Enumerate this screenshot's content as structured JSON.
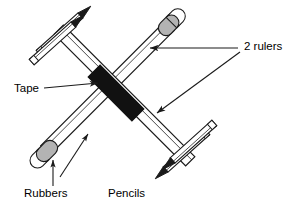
{
  "diagram": {
    "background_color": "#ffffff",
    "line_color": "#1a1a1a",
    "tape_color": "#111111",
    "rubber_color": "#b3b3b3",
    "pencil_tip_color": "#1a1a1a",
    "ruler_fill": "#ffffff"
  },
  "labels": {
    "rulers": {
      "text": "2 rulers",
      "x": 244,
      "y": 50
    },
    "tape": {
      "text": "Tape",
      "x": 14,
      "y": 92
    },
    "rubbers": {
      "text": "Rubbers",
      "x": 24,
      "y": 196
    },
    "pencils": {
      "text": "Pencils",
      "x": 108,
      "y": 196
    }
  },
  "parts": {
    "ruler_a": {
      "name": "ruler-nw-se",
      "from": [
        58,
        28
      ],
      "to": [
        196,
        165
      ]
    },
    "ruler_b": {
      "name": "ruler-ne-sw",
      "from": [
        171,
        24
      ],
      "to": [
        44,
        152
      ]
    },
    "tape": {
      "name": "black-tape",
      "center": [
        115,
        93
      ]
    },
    "rubber_top_right": {
      "name": "rubber-top-right",
      "center": [
        169,
        22
      ]
    },
    "rubber_bottom_left": {
      "name": "rubber-bottom-left",
      "center": [
        45,
        153
      ]
    },
    "pencils_top_left": {
      "name": "pencil-pair-top-left",
      "count": 2,
      "tip_direction": "up-right"
    },
    "pencils_bottom_right": {
      "name": "pencil-pair-bottom-right",
      "count": 2,
      "tip_direction": "down-left"
    }
  },
  "leaders": {
    "rulers_upper": {
      "from": [
        238,
        48
      ],
      "to": [
        146,
        48
      ]
    },
    "rulers_lower": {
      "from": [
        238,
        50
      ],
      "to": [
        152,
        116
      ]
    },
    "tape": {
      "from": [
        44,
        88
      ],
      "to": [
        101,
        84
      ]
    },
    "rubbers": {
      "from": [
        53,
        186
      ],
      "to": [
        53,
        157
      ]
    },
    "ruler_direction": {
      "from": [
        62,
        175
      ],
      "to": [
        89,
        133
      ]
    }
  }
}
